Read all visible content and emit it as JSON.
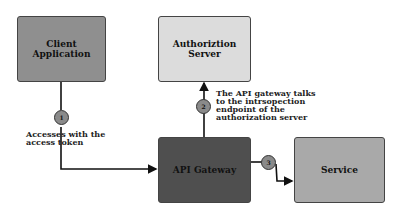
{
  "nodes": {
    "client": {
      "label": "Client Application",
      "color": "#8f8f8f"
    },
    "auth": {
      "label": "Authoriztion Server",
      "color": "#dcdcdc"
    },
    "gateway": {
      "label": "API Gateway",
      "color": "#4f4f4f"
    },
    "service": {
      "label": "Service",
      "color": "#a9a9a9"
    }
  },
  "steps": [
    {
      "number": "1",
      "label_lines": [
        "Accesses with the",
        "access token"
      ]
    },
    {
      "number": "2",
      "label_lines": [
        "The API gateway talks",
        "to the intrsopection",
        "endpoint of the",
        "authorization server"
      ]
    },
    {
      "number": "3"
    }
  ]
}
